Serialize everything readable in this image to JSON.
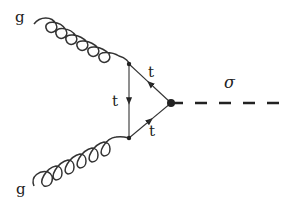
{
  "diagram": {
    "type": "feynman",
    "particles": {
      "gluon_top": {
        "label": "g"
      },
      "gluon_bottom": {
        "label": "g"
      },
      "top_upper": {
        "label": "t"
      },
      "top_left": {
        "label": "t"
      },
      "top_lower": {
        "label": "t"
      },
      "scalar": {
        "label": "σ"
      }
    },
    "colors": {
      "line": "#333333",
      "background": "#ffffff"
    }
  }
}
